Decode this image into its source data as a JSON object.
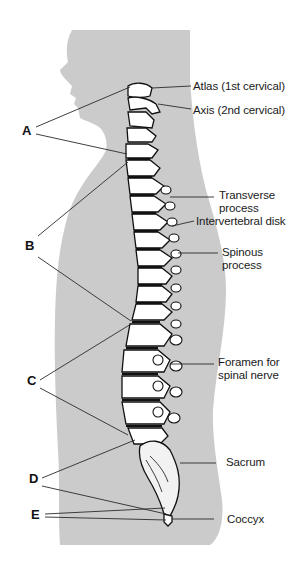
{
  "figure": {
    "colors": {
      "silhouette": "#cbcbcb",
      "bone_fill": "#ffffff",
      "outline": "#111111",
      "leader_line": "#2a2a2a",
      "background": "#ffffff"
    }
  },
  "right_labels": [
    {
      "id": "atlas",
      "lines": [
        "Atlas (1st cervical)"
      ]
    },
    {
      "id": "axis",
      "lines": [
        "Axis (2nd cervical)"
      ]
    },
    {
      "id": "transverse",
      "lines": [
        "Transverse",
        "process"
      ]
    },
    {
      "id": "intervertebral",
      "lines": [
        "Intervertebral disk"
      ]
    },
    {
      "id": "spinous",
      "lines": [
        "Spinous",
        "process"
      ]
    },
    {
      "id": "foramen",
      "lines": [
        "Foramen for",
        "spinal nerve"
      ]
    },
    {
      "id": "sacrum",
      "lines": [
        "Sacrum"
      ]
    },
    {
      "id": "coccyx",
      "lines": [
        "Coccyx"
      ]
    }
  ],
  "left_letters": [
    {
      "id": "A",
      "text": "A"
    },
    {
      "id": "B",
      "text": "B"
    },
    {
      "id": "C",
      "text": "C"
    },
    {
      "id": "D",
      "text": "D"
    },
    {
      "id": "E",
      "text": "E"
    }
  ]
}
